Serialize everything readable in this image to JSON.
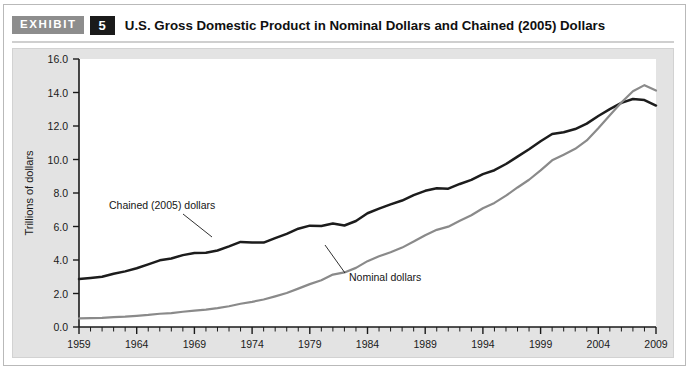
{
  "header": {
    "exhibit_tag": "EXHIBIT",
    "exhibit_number": "5",
    "title": "U.S. Gross Domestic Product in Nominal Dollars and Chained (2005) Dollars"
  },
  "chart_data": {
    "type": "line",
    "title": "U.S. Gross Domestic Product in Nominal Dollars and Chained (2005) Dollars",
    "xlabel": "",
    "ylabel": "Trillions of dollars",
    "xlim": [
      1959,
      2009
    ],
    "ylim": [
      0.0,
      16.0
    ],
    "ytick_step": 2.0,
    "grid": false,
    "legend_position": "inline-annotations",
    "yticks": [
      "0.0",
      "2.0",
      "4.0",
      "6.0",
      "8.0",
      "10.0",
      "12.0",
      "14.0",
      "16.0"
    ],
    "xticks": [
      "1959",
      "1964",
      "1969",
      "1974",
      "1979",
      "1984",
      "1989",
      "1994",
      "1999",
      "2004",
      "2009"
    ],
    "x": [
      1959,
      1960,
      1961,
      1962,
      1963,
      1964,
      1965,
      1966,
      1967,
      1968,
      1969,
      1970,
      1971,
      1972,
      1973,
      1974,
      1975,
      1976,
      1977,
      1978,
      1979,
      1980,
      1981,
      1982,
      1983,
      1984,
      1985,
      1986,
      1987,
      1988,
      1989,
      1990,
      1991,
      1992,
      1993,
      1994,
      1995,
      1996,
      1997,
      1998,
      1999,
      2000,
      2001,
      2002,
      2003,
      2004,
      2005,
      2006,
      2007,
      2008,
      2009
    ],
    "series": [
      {
        "name": "Chained (2005) dollars",
        "color": "#1c1c1c",
        "annotation": "Chained (2005) dollars",
        "values": [
          2.86,
          2.93,
          3.0,
          3.18,
          3.32,
          3.51,
          3.74,
          3.98,
          4.09,
          4.29,
          4.42,
          4.43,
          4.57,
          4.81,
          5.08,
          5.05,
          5.04,
          5.31,
          5.56,
          5.87,
          6.05,
          6.03,
          6.18,
          6.06,
          6.33,
          6.79,
          7.07,
          7.32,
          7.55,
          7.87,
          8.13,
          8.28,
          8.26,
          8.54,
          8.78,
          9.13,
          9.36,
          9.73,
          10.17,
          10.61,
          11.09,
          11.52,
          11.63,
          11.82,
          12.14,
          12.6,
          13.01,
          13.38,
          13.61,
          13.55,
          13.22
        ]
      },
      {
        "name": "Nominal dollars",
        "color": "#8a8a8a",
        "annotation": "Nominal dollars",
        "values": [
          0.51,
          0.53,
          0.55,
          0.59,
          0.62,
          0.67,
          0.72,
          0.79,
          0.83,
          0.91,
          0.98,
          1.04,
          1.13,
          1.24,
          1.39,
          1.5,
          1.64,
          1.83,
          2.03,
          2.29,
          2.56,
          2.79,
          3.13,
          3.26,
          3.53,
          3.93,
          4.22,
          4.46,
          4.74,
          5.1,
          5.48,
          5.8,
          5.99,
          6.34,
          6.67,
          7.09,
          7.41,
          7.84,
          8.33,
          8.79,
          9.35,
          9.95,
          10.29,
          10.64,
          11.14,
          11.87,
          12.64,
          13.4,
          14.08,
          14.44,
          14.12
        ]
      }
    ]
  }
}
